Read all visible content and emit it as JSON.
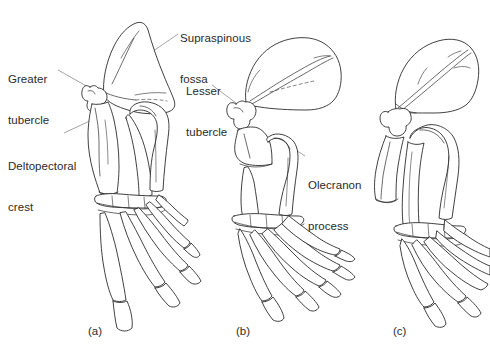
{
  "figure": {
    "background_color": "#ffffff",
    "line_color": "#2b2b2b",
    "leader_line_color": "#8d8d8d",
    "text_color": "#2b2b2b"
  },
  "annotations": [
    {
      "id": "supraspinous-fossa",
      "line1": "Supraspinous",
      "line2": "fossa",
      "text": "Supraspinous fossa"
    },
    {
      "id": "greater-tubercle",
      "line1": "Greater",
      "line2": "tubercle",
      "text": "Greater tubercle"
    },
    {
      "id": "deltopectoral-crest",
      "line1": "Deltopectoral",
      "line2": "crest",
      "text": "Deltopectoral crest"
    },
    {
      "id": "lesser-tubercle",
      "line1": "Lesser",
      "line2": "tubercle",
      "text": "Lesser tubercle"
    },
    {
      "id": "olecranon-process",
      "line1": "Olecranon",
      "line2": "process",
      "text": "Olecranon process"
    }
  ],
  "panels": [
    {
      "id": "panel-a",
      "label": "(a)"
    },
    {
      "id": "panel-b",
      "label": "(b)"
    },
    {
      "id": "panel-c",
      "label": "(c)"
    }
  ]
}
